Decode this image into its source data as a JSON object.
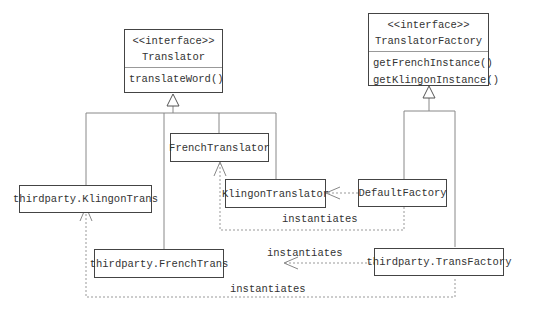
{
  "diagram": {
    "type": "uml-class-diagram",
    "interfaces": [
      {
        "id": "translator",
        "stereotype": "<<interface>>",
        "name": "Translator",
        "operations": [
          "translateWord()"
        ]
      },
      {
        "id": "translator_factory",
        "stereotype": "<<interface>>",
        "name": "TranslatorFactory",
        "operations": [
          "getFrenchInstance()",
          "getKlingonInstance()"
        ]
      }
    ],
    "classes": [
      {
        "id": "french_translator",
        "name": "FrenchTranslator"
      },
      {
        "id": "klingon_translator",
        "name": "KlingonTranslator"
      },
      {
        "id": "default_factory",
        "name": "DefaultFactory"
      },
      {
        "id": "tp_klingon_trans",
        "name": "thirdparty.KlingonTrans"
      },
      {
        "id": "tp_french_trans",
        "name": "thirdparty.FrenchTrans"
      },
      {
        "id": "tp_trans_factory",
        "name": "thirdparty.TransFactory"
      }
    ],
    "relationships": [
      {
        "type": "realization",
        "from": "FrenchTranslator",
        "to": "Translator"
      },
      {
        "type": "realization",
        "from": "KlingonTranslator",
        "to": "Translator"
      },
      {
        "type": "realization",
        "from": "thirdparty.KlingonTrans",
        "to": "Translator"
      },
      {
        "type": "realization",
        "from": "thirdparty.FrenchTrans",
        "to": "Translator"
      },
      {
        "type": "realization",
        "from": "DefaultFactory",
        "to": "TranslatorFactory"
      },
      {
        "type": "realization",
        "from": "thirdparty.TransFactory",
        "to": "TranslatorFactory"
      },
      {
        "type": "dependency",
        "from": "DefaultFactory",
        "to": "KlingonTranslator",
        "label": ""
      },
      {
        "type": "dependency",
        "from": "DefaultFactory",
        "to": "FrenchTranslator",
        "label": "instantiates"
      },
      {
        "type": "dependency",
        "from": "thirdparty.TransFactory",
        "to": "thirdparty.FrenchTrans",
        "label": "instantiates"
      },
      {
        "type": "dependency",
        "from": "thirdparty.TransFactory",
        "to": "thirdparty.KlingonTrans",
        "label": "instantiates"
      }
    ],
    "labels": {
      "default_to_french": "instantiates",
      "tp_factory_to_french": "instantiates",
      "tp_factory_to_klingon": "instantiates"
    }
  }
}
